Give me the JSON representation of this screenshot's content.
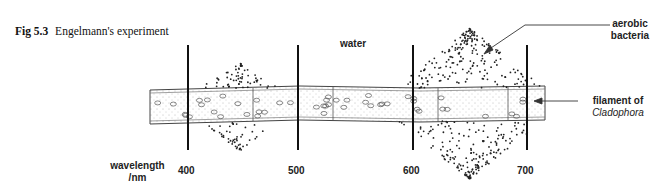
{
  "caption": {
    "figure_number": "Fig 5.3",
    "title": "Engelmann's experiment"
  },
  "labels": {
    "water": "water",
    "bacteria_line1": "aerobic",
    "bacteria_line2": "bacteria",
    "filament_line1": "filament of",
    "filament_line2": "Cladophora",
    "axis_line1": "wavelength",
    "axis_line2": "/nm"
  },
  "wavelength_ticks": [
    "400",
    "500",
    "600",
    "700"
  ],
  "bacteria_clusters": [
    {
      "region": "around 450 nm (blue)",
      "density": "moderate"
    },
    {
      "region": "around 650-680 nm (red)",
      "density": "high"
    }
  ],
  "colors": {
    "ink": "#111111",
    "background": "#ffffff"
  }
}
